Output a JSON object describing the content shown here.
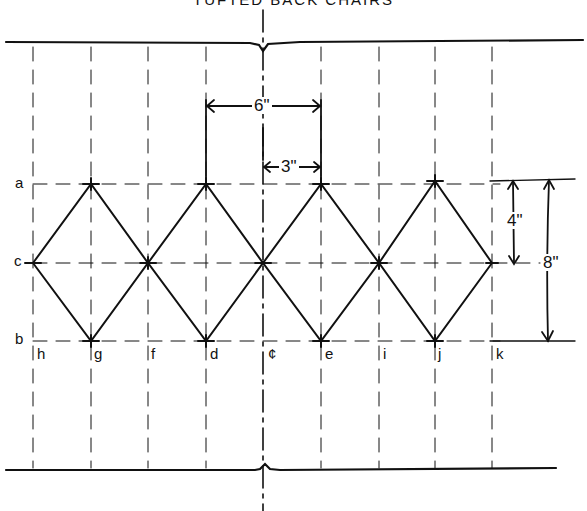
{
  "title": "TUFTED BACK CHAIRS",
  "colors": {
    "ink": "#111111",
    "paper": "#ffffff"
  },
  "rows": {
    "a": {
      "label": "a",
      "y": 184
    },
    "c": {
      "label": "c",
      "y": 263
    },
    "b": {
      "label": "b",
      "y": 341
    }
  },
  "columns": [
    {
      "label": "h",
      "x": 33
    },
    {
      "label": "g",
      "x": 91
    },
    {
      "label": "f",
      "x": 148
    },
    {
      "label": "d",
      "x": 206
    },
    {
      "label": "¢",
      "x": 263
    },
    {
      "label": "e",
      "x": 321
    },
    {
      "label": "i",
      "x": 379
    },
    {
      "label": "j",
      "x": 435
    },
    {
      "label": "k",
      "x": 492
    }
  ],
  "dimensions": {
    "horizontal_6": "6\"",
    "horizontal_3": "3\"",
    "vertical_4": "4\"",
    "vertical_8": "8\""
  },
  "lines": {
    "top_y": 42,
    "bottom_y": 470
  }
}
